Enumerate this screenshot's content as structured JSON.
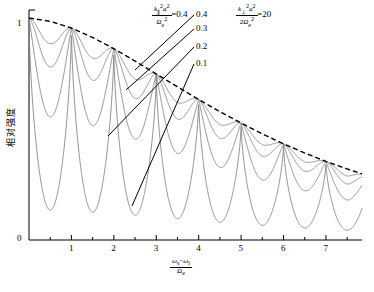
{
  "chart_data": {
    "type": "line",
    "title": "",
    "xlabel": "(omega_s - omega_i) / Omega_e",
    "ylabel": "相对强度",
    "xlim": [
      0,
      7.85
    ],
    "ylim": [
      0,
      1.0
    ],
    "grid": false,
    "x_ticks": [
      "1",
      "2",
      "3",
      "4",
      "5",
      "6",
      "7"
    ],
    "x_tick_values": [
      1,
      2,
      3,
      4,
      5,
      6,
      7
    ],
    "x_minor_ticks": [
      0.5,
      1.5,
      2.5,
      3.5,
      4.5,
      5.5,
      6.5,
      7.5
    ],
    "y_ticks": [
      "0",
      "1"
    ],
    "y_tick_values": [
      0,
      1
    ],
    "legend_position": "inside-top-right",
    "envelope": {
      "name": "envelope",
      "style": "dashed",
      "color": "#000000",
      "x": [
        0,
        0.5,
        1,
        1.5,
        2,
        2.5,
        3,
        3.5,
        4,
        4.5,
        5,
        5.5,
        6,
        6.5,
        7,
        7.5,
        7.85
      ],
      "y": [
        1.0,
        0.985,
        0.955,
        0.912,
        0.862,
        0.806,
        0.748,
        0.69,
        0.633,
        0.578,
        0.527,
        0.478,
        0.433,
        0.392,
        0.354,
        0.32,
        0.298
      ]
    },
    "series": [
      {
        "name": "0.4",
        "label": "0.4",
        "modulation_depth": 0.4,
        "color": "#808080",
        "peaks_x": [
          0,
          1,
          2,
          3,
          4,
          5,
          6,
          7
        ],
        "peaks_y": [
          1.0,
          0.955,
          0.862,
          0.748,
          0.633,
          0.527,
          0.433,
          0.354
        ],
        "minima_x": [
          0.5,
          1.5,
          2.5,
          3.5,
          4.5,
          5.5,
          6.5,
          7.5
        ],
        "minima_y": [
          0.885,
          0.82,
          0.725,
          0.62,
          0.52,
          0.43,
          0.352,
          0.288
        ]
      },
      {
        "name": "0.3",
        "label": "0.3",
        "modulation_depth": 0.3,
        "color": "#808080",
        "peaks_x": [
          0,
          1,
          2,
          3,
          4,
          5,
          6,
          7
        ],
        "peaks_y": [
          1.0,
          0.955,
          0.862,
          0.748,
          0.633,
          0.527,
          0.433,
          0.354
        ],
        "minima_x": [
          0.5,
          1.5,
          2.5,
          3.5,
          4.5,
          5.5,
          6.5,
          7.5
        ],
        "minima_y": [
          0.78,
          0.72,
          0.638,
          0.545,
          0.458,
          0.378,
          0.31,
          0.252
        ]
      },
      {
        "name": "0.2",
        "label": "0.2",
        "modulation_depth": 0.2,
        "color": "#808080",
        "peaks_x": [
          0,
          1,
          2,
          3,
          4,
          5,
          6,
          7
        ],
        "peaks_y": [
          1.0,
          0.955,
          0.862,
          0.748,
          0.633,
          0.527,
          0.433,
          0.354
        ],
        "minima_x": [
          0.5,
          1.5,
          2.5,
          3.5,
          4.5,
          5.5,
          6.5,
          7.5
        ],
        "minima_y": [
          0.555,
          0.515,
          0.455,
          0.39,
          0.327,
          0.27,
          0.222,
          0.18
        ]
      },
      {
        "name": "0.1",
        "label": "0.1",
        "modulation_depth": 0.1,
        "color": "#808080",
        "peaks_x": [
          0,
          1,
          2,
          3,
          4,
          5,
          6,
          7
        ],
        "peaks_y": [
          1.0,
          0.955,
          0.862,
          0.748,
          0.633,
          0.527,
          0.433,
          0.354
        ],
        "minima_x": [
          0.5,
          1.5,
          2.5,
          3.5,
          4.5,
          5.5,
          6.5,
          7.5
        ],
        "minima_y": [
          0.135,
          0.125,
          0.112,
          0.096,
          0.08,
          0.066,
          0.054,
          0.044
        ]
      }
    ],
    "annotations": [
      {
        "name": "parallel-parameter",
        "numerator": "k∥²a²",
        "denominator": "Ωe²",
        "equals": "=",
        "value": "0.4"
      },
      {
        "name": "perpendicular-parameter",
        "numerator": "k⊥²a²",
        "denominator": "2Ωe²",
        "equals": "=",
        "value": "20"
      }
    ]
  },
  "axis": {
    "y_label_text": "相对强度",
    "y_tick_top": "1",
    "y_tick_bottom": "0",
    "x_tick_labels": [
      "1",
      "2",
      "3",
      "4",
      "5",
      "6",
      "7"
    ],
    "x_label_num_left": "ω",
    "x_label_num_left_sub": "s",
    "x_label_minus": "−",
    "x_label_num_right": "ω",
    "x_label_num_right_sub": "i",
    "x_label_den": "Ω",
    "x_label_den_sub": "e"
  },
  "annotation_left": {
    "k": "k",
    "k_sub": "∥",
    "k_sup": "2",
    "a": "a",
    "a_sup": "2",
    "omega": "Ω",
    "omega_sub": "e",
    "omega_sup": "2",
    "equals": "=",
    "value": "0.4"
  },
  "annotation_right": {
    "k": "k",
    "k_sub": "⊥",
    "k_sup": "2",
    "a": "a",
    "a_sup": "2",
    "two": "2",
    "omega": "Ω",
    "omega_sub": "e",
    "omega_sup": "2",
    "equals": "=",
    "value": "20"
  },
  "curve_labels": [
    {
      "name": "curve-label-04",
      "text": "0.4"
    },
    {
      "name": "curve-label-03",
      "text": "0.3"
    },
    {
      "name": "curve-label-02",
      "text": "0.2"
    },
    {
      "name": "curve-label-01",
      "text": "0.1"
    }
  ]
}
